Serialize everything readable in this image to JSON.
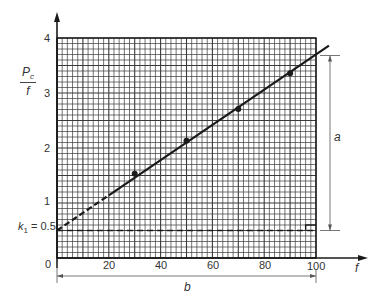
{
  "chart_data": {
    "type": "scatter",
    "title": "",
    "xlabel": "f",
    "ylabel": "P_c / f",
    "ylabel_numerator": "P",
    "ylabel_subscript": "c",
    "ylabel_denominator": "f",
    "xlim": [
      0,
      100
    ],
    "ylim": [
      0,
      4
    ],
    "grid": true,
    "x_ticks": [
      "0",
      "20",
      "40",
      "60",
      "80",
      "100"
    ],
    "y_ticks": [
      "1",
      "2",
      "3",
      "4"
    ],
    "series": [
      {
        "name": "measured points",
        "x": [
          30,
          50,
          70,
          90
        ],
        "y": [
          1.53,
          2.13,
          2.71,
          3.36
        ]
      },
      {
        "name": "fitted line",
        "x": [
          0,
          100
        ],
        "y": [
          0.5,
          3.7
        ],
        "style": "solid (dashed extrapolation from f=0 to f≈20)"
      }
    ],
    "annotations": {
      "intercept_label": "k",
      "intercept_subscript": "1",
      "intercept_value_text": "= 0.5",
      "intercept_value": 0.5,
      "dimension_a_label": "a",
      "dimension_a_value": 3.2,
      "dimension_b_label": "b",
      "dimension_b_value": 100
    }
  },
  "axis": {
    "origin_label": "0",
    "x_label": "f",
    "x_ticks": [
      "20",
      "40",
      "60",
      "80",
      "100"
    ],
    "y_ticks": [
      "4",
      "3",
      "2",
      "1"
    ]
  },
  "colors": {
    "ink": "#1a1a1a",
    "grid": "#3a3a3a",
    "text": "#333333"
  }
}
